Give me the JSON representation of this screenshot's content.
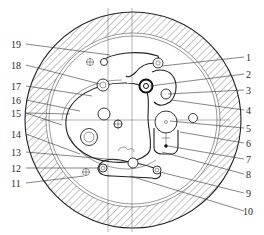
{
  "diagram": {
    "title": "",
    "colors": {
      "line": "#222222",
      "hatch": "#555555",
      "background": "#ffffff",
      "label": "#2a2a2a"
    },
    "callouts_left": [
      {
        "number": "19",
        "label": "19"
      },
      {
        "number": "18",
        "label": "18"
      },
      {
        "number": "17",
        "label": "17"
      },
      {
        "number": "16",
        "label": "16"
      },
      {
        "number": "15",
        "label": "15"
      },
      {
        "number": "14",
        "label": "14"
      },
      {
        "number": "13",
        "label": "13"
      },
      {
        "number": "12",
        "label": "12"
      },
      {
        "number": "11",
        "label": "11"
      }
    ],
    "callouts_right": [
      {
        "number": "1",
        "label": "1"
      },
      {
        "number": "2",
        "label": "2"
      },
      {
        "number": "3",
        "label": "3"
      },
      {
        "number": "4",
        "label": "4"
      },
      {
        "number": "5",
        "label": "5"
      },
      {
        "number": "6",
        "label": "6"
      },
      {
        "number": "7",
        "label": "7"
      },
      {
        "number": "8",
        "label": "8"
      },
      {
        "number": "9",
        "label": "9"
      },
      {
        "number": "10",
        "label": "10"
      }
    ]
  }
}
